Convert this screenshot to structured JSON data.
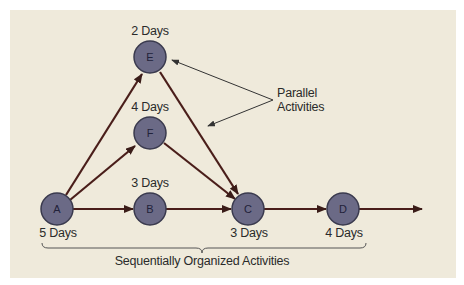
{
  "diagram": {
    "nodes": [
      {
        "id": "A",
        "label": "A",
        "duration": "5 Days"
      },
      {
        "id": "B",
        "label": "B",
        "duration": "3 Days"
      },
      {
        "id": "C",
        "label": "C",
        "duration": "3 Days"
      },
      {
        "id": "D",
        "label": "D",
        "duration": "4 Days"
      },
      {
        "id": "E",
        "label": "E",
        "duration": "2 Days"
      },
      {
        "id": "F",
        "label": "F",
        "duration": "4 Days"
      }
    ],
    "edges": [
      {
        "from": "A",
        "to": "E"
      },
      {
        "from": "A",
        "to": "F"
      },
      {
        "from": "A",
        "to": "B"
      },
      {
        "from": "B",
        "to": "C"
      },
      {
        "from": "E",
        "to": "C"
      },
      {
        "from": "F",
        "to": "C"
      },
      {
        "from": "C",
        "to": "D"
      },
      {
        "from": "D",
        "to": "end"
      }
    ],
    "annotations": {
      "parallel_line1": "Parallel",
      "parallel_line2": "Activities",
      "sequential": "Sequentially Organized Activities"
    },
    "colors": {
      "background": "#efeadb",
      "node_fill": "#6b6a86",
      "node_stroke": "#3a3a4e",
      "arrow": "#4a1e1a",
      "text": "#2a2a2a"
    }
  }
}
